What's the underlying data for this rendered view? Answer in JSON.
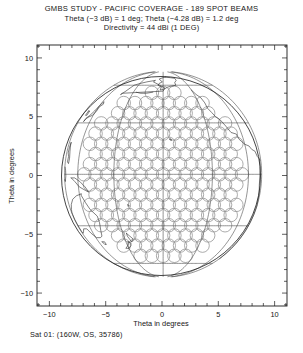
{
  "title": {
    "line1": "GMBS STUDY -  PACIFIC COVERAGE - 189 SPOT BEAMS",
    "line2": "Theta (−3 dB) = 1 deg;  Theta (−4.28 dB) = 1.2 deg",
    "line3": "Directivity = 44 dBi (1 DEG)"
  },
  "caption": "Sat 01:  (160W, OS, 35786)",
  "axes": {
    "xlabel": "Theta in degrees",
    "ylabel": "Theta in degrees",
    "xticks": [
      -10,
      -5,
      0,
      5,
      10
    ],
    "yticks": [
      -10,
      -5,
      0,
      5,
      10
    ],
    "xtick_labels": [
      "−10",
      "−5",
      "0",
      "5",
      "10"
    ],
    "ytick_labels": [
      "−10",
      "−5",
      "0",
      "5",
      "10"
    ],
    "xlim": [
      -11.1,
      11.1
    ],
    "ylim": [
      -11.1,
      11.1
    ],
    "minor_tick_step": 1,
    "grid": false
  },
  "chart_data": {
    "type": "scatter",
    "title": "GMBS STUDY -  PACIFIC COVERAGE - 189 SPOT BEAMS",
    "subtitle": "Theta (−3 dB) = 1 deg;  Theta (−4.28 dB) = 1.2 deg / Directivity = 44 dBi (1 DEG)",
    "xlabel": "Theta in degrees",
    "ylabel": "Theta in degrees",
    "xlim": [
      -11.1,
      11.1
    ],
    "ylim": [
      -11.1,
      11.1
    ],
    "grid": false,
    "legend": "none",
    "beam_count": 189,
    "beam_diameter_deg": 1.2,
    "beam_spacing_deg": 1.0,
    "beam_contour_db": -4.28,
    "beam_peak_directivity_dbi": 44,
    "earth_disk": {
      "center": [
        0.1,
        0.1
      ],
      "radius_deg": 8.75
    },
    "satellite": {
      "label": "Sat 01",
      "longitude": "160W",
      "station": "OS",
      "altitude_km": 35786
    }
  },
  "colors": {
    "axis": "#1a1a1a",
    "beam": "#8a8a8a",
    "earth_limb": "#2a2a2a",
    "graticule": "#555555",
    "coastline": "#2b2b2b",
    "background": "#ffffff"
  }
}
